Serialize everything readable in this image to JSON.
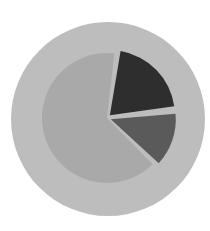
{
  "chart_data": {
    "type": "pie",
    "title": "",
    "categories": [
      "Large slice",
      "Dark slice",
      "Medium slice"
    ],
    "values": [
      65,
      21,
      14
    ],
    "colors": {
      "background": "#ffffff",
      "outer_ring": "#bdbdbd",
      "slices": [
        "#a9a9a9",
        "#2e2e2e",
        "#5a5a5a"
      ]
    },
    "legend": null,
    "labels_shown": false,
    "exploded": [
      false,
      true,
      true
    ]
  }
}
